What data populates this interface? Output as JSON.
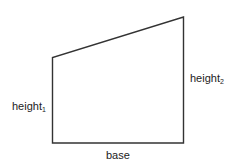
{
  "diagram": {
    "shape": "trapezoid",
    "stroke_color": "#333333",
    "points": {
      "bottom_left": [
        52.5,
        143
      ],
      "top_left": [
        52.5,
        57.5
      ],
      "top_right": [
        183.5,
        17
      ],
      "bottom_right": [
        183.5,
        143
      ]
    },
    "labels": {
      "height1": {
        "text": "height",
        "subscript": "1"
      },
      "height2": {
        "text": "height",
        "subscript": "2"
      },
      "base": {
        "text": "base"
      }
    }
  }
}
